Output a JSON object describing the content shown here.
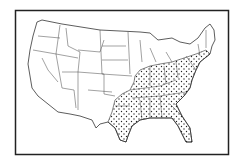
{
  "figure": {
    "type": "map",
    "frame": {
      "x": 15,
      "y": 10,
      "width": 214,
      "height": 145,
      "stroke": "#222222"
    },
    "colors": {
      "background": "#ffffff",
      "outline": "#333333",
      "stipple": "#222222"
    },
    "legend": null,
    "shaded_region": {
      "pattern": "stipple-dots",
      "description": "Eastern and southeastern states shaded with dots",
      "states": [
        "TX (east)",
        "OK (east)",
        "AR",
        "LA",
        "MO (south)",
        "MS",
        "AL",
        "GA",
        "FL",
        "SC",
        "NC",
        "TN",
        "KY",
        "VA",
        "WV",
        "MD",
        "DE",
        "NJ",
        "PA",
        "OH",
        "IN",
        "IL (south)",
        "NY (south)",
        "CT",
        "RI",
        "MA (south)"
      ]
    },
    "unshaded_region": {
      "description": "Western, plains, and upper midwest / northern New England states unshaded"
    }
  }
}
